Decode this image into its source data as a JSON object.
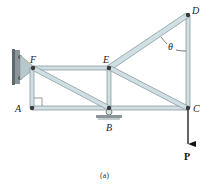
{
  "figure": {
    "caption": "(a)",
    "type": "truss",
    "joints": {
      "A": {
        "label": "A"
      },
      "B": {
        "label": "B"
      },
      "C": {
        "label": "C"
      },
      "D": {
        "label": "D"
      },
      "E": {
        "label": "E"
      },
      "F": {
        "label": "F"
      }
    },
    "angle_label": "θ",
    "load_label": "P",
    "supports": {
      "wall": "pin at F (wall bracket)",
      "roller": "roller at B"
    },
    "members": [
      "FE",
      "AB",
      "BC",
      "FA",
      "EB",
      "DC",
      "ED",
      "FB",
      "EC"
    ],
    "colors": {
      "member_fill": "#cfdfe4",
      "member_edge": "#7f9096",
      "pin": "#3a3a3a",
      "arrow": "#111111"
    }
  }
}
